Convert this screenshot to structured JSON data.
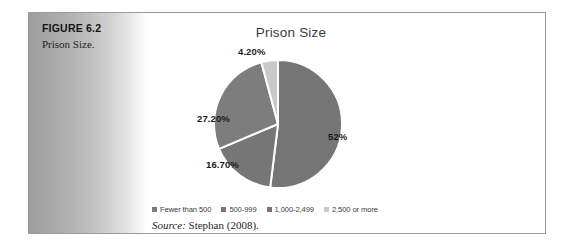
{
  "figure": {
    "label": "FIGURE 6.2",
    "caption": "Prison Size."
  },
  "source": {
    "label": "Source:",
    "citation": " Stephan (2008)."
  },
  "chart_data": {
    "type": "pie",
    "title": "Prison Size",
    "xlabel": "",
    "ylabel": "",
    "legend_position": "bottom",
    "grid": false,
    "categories": [
      "Fewer than 500",
      "500-999",
      "1,000-2,499",
      "2,500 or more"
    ],
    "values": [
      27.2,
      16.7,
      52.0,
      4.2
    ],
    "data_labels": [
      "27.20%",
      "16.70%",
      "52%",
      "4.20%"
    ],
    "slice_colors": [
      "#7d7d7d",
      "#767676",
      "#757575",
      "#c9c9c9"
    ],
    "legend": [
      {
        "label": "Fewer than 500",
        "color": "#7d7d7d"
      },
      {
        "label": "500-999",
        "color": "#767676"
      },
      {
        "label": "1,000-2,499",
        "color": "#757575"
      },
      {
        "label": "2,500 or more",
        "color": "#c9c9c9"
      }
    ],
    "slices": [
      {
        "label": "1,000-2,499",
        "value": 52.0,
        "data_label": "52%",
        "color": "#757575"
      },
      {
        "label": "500-999",
        "value": 16.7,
        "data_label": "16.70%",
        "color": "#767676"
      },
      {
        "label": "Fewer than 500",
        "value": 27.2,
        "data_label": "27.20%",
        "color": "#7d7d7d"
      },
      {
        "label": "2,500 or more",
        "value": 4.2,
        "data_label": "4.20%",
        "color": "#c9c9c9"
      }
    ]
  }
}
